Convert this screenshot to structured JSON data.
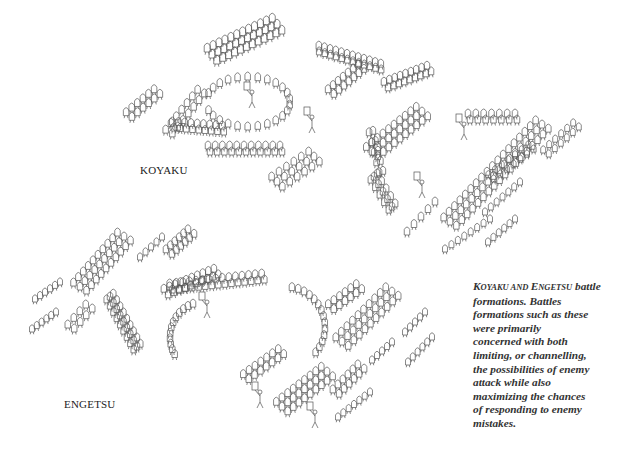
{
  "labels": {
    "koyaku": "KOYAKU",
    "engetsu": "ENGETSU"
  },
  "caption": {
    "title_parts": [
      {
        "cap": "K",
        "rest": "OYAKU"
      },
      {
        "plain": " AND "
      },
      {
        "cap": "E",
        "rest": "NGETSU"
      },
      {
        "plain": " battle"
      }
    ],
    "lines": [
      "KOYAKU AND ENGETSU battle",
      "formations. Battles",
      "formations such as these",
      "were primarily",
      "concerned with both",
      "limiting, or channelling,",
      "the possibilities of enemy",
      "attack while also",
      "maximizing the chances",
      "of responding to enemy",
      "mistakes."
    ]
  },
  "figure": {
    "stroke_color": "#555555",
    "background": "#ffffff",
    "koyaku_formations": [
      {
        "name": "left-small-squad",
        "type": "line",
        "from": [
          128,
          118
        ],
        "to": [
          156,
          95
        ],
        "count": 6,
        "rows": 2,
        "size": 10
      },
      {
        "name": "top-diagonal-column",
        "type": "line",
        "from": [
          210,
          58
        ],
        "to": [
          275,
          28
        ],
        "count": 12,
        "rows": 3,
        "size": 11
      },
      {
        "name": "left-arc-outer",
        "type": "line",
        "from": [
          168,
          135
        ],
        "to": [
          200,
          95
        ],
        "count": 7,
        "rows": 2,
        "size": 10
      },
      {
        "name": "central-ring",
        "type": "arc",
        "cx": 248,
        "cy": 105,
        "rx": 42,
        "ry": 25,
        "a0": 200,
        "a1": 520,
        "count": 24,
        "size": 10
      },
      {
        "name": "ring-left-block",
        "type": "line",
        "from": [
          172,
          128
        ],
        "to": [
          222,
          132
        ],
        "count": 9,
        "rows": 2,
        "size": 10
      },
      {
        "name": "ring-bottom-block",
        "type": "line",
        "from": [
          208,
          152
        ],
        "to": [
          280,
          152
        ],
        "count": 11,
        "rows": 2,
        "size": 10
      },
      {
        "name": "upper-right-column-1",
        "type": "line",
        "from": [
          318,
          52
        ],
        "to": [
          380,
          70
        ],
        "count": 12,
        "rows": 2,
        "size": 10
      },
      {
        "name": "upper-right-column-2",
        "type": "line",
        "from": [
          330,
          95
        ],
        "to": [
          360,
          70
        ],
        "count": 7,
        "rows": 2,
        "size": 10
      },
      {
        "name": "upper-right-column-3",
        "type": "line",
        "from": [
          385,
          88
        ],
        "to": [
          428,
          72
        ],
        "count": 9,
        "rows": 2,
        "size": 10
      },
      {
        "name": "mid-arc-column",
        "type": "line",
        "from": [
          370,
          155
        ],
        "to": [
          420,
          115
        ],
        "count": 10,
        "rows": 3,
        "size": 10
      },
      {
        "name": "mid-vertical-block",
        "type": "line",
        "from": [
          370,
          135
        ],
        "to": [
          380,
          175
        ],
        "count": 5,
        "rows": 2,
        "size": 10
      },
      {
        "name": "center-lower-block",
        "type": "line",
        "from": [
          275,
          185
        ],
        "to": [
          312,
          160
        ],
        "count": 6,
        "rows": 3,
        "size": 10
      },
      {
        "name": "pikes-block",
        "type": "line",
        "from": [
          372,
          180
        ],
        "to": [
          390,
          210
        ],
        "count": 5,
        "rows": 3,
        "size": 10
      },
      {
        "name": "bottom-small-row",
        "type": "line",
        "from": [
          407,
          235
        ],
        "to": [
          435,
          205
        ],
        "count": 5,
        "rows": 1,
        "size": 10
      },
      {
        "name": "right-top-row",
        "type": "line",
        "from": [
          468,
          120
        ],
        "to": [
          515,
          120
        ],
        "count": 7,
        "rows": 2,
        "size": 10
      },
      {
        "name": "right-long-diagonal-1",
        "type": "line",
        "from": [
          448,
          225
        ],
        "to": [
          540,
          128
        ],
        "count": 18,
        "rows": 3,
        "size": 10
      },
      {
        "name": "right-diagonal-2",
        "type": "line",
        "from": [
          490,
          180
        ],
        "to": [
          530,
          150
        ],
        "count": 7,
        "rows": 2,
        "size": 9
      },
      {
        "name": "right-diagonal-3",
        "type": "line",
        "from": [
          545,
          155
        ],
        "to": [
          575,
          128
        ],
        "count": 6,
        "rows": 2,
        "size": 9
      },
      {
        "name": "right-lower-row-1",
        "type": "line",
        "from": [
          485,
          215
        ],
        "to": [
          520,
          185
        ],
        "count": 7,
        "rows": 1,
        "size": 9
      },
      {
        "name": "right-lower-row-2",
        "type": "line",
        "from": [
          445,
          252
        ],
        "to": [
          490,
          222
        ],
        "count": 8,
        "rows": 1,
        "size": 9
      },
      {
        "name": "right-lower-row-3",
        "type": "line",
        "from": [
          488,
          245
        ],
        "to": [
          515,
          222
        ],
        "count": 6,
        "rows": 1,
        "size": 9
      }
    ],
    "koyaku_leaders": [
      {
        "name": "commander-center",
        "pos": [
          250,
          100
        ]
      },
      {
        "name": "flag-bearer-right",
        "pos": [
          462,
          132
        ]
      },
      {
        "name": "flag-bearer-lower",
        "pos": [
          420,
          190
        ]
      },
      {
        "name": "runner-center",
        "pos": [
          310,
          125
        ]
      }
    ],
    "engetsu_formations": [
      {
        "name": "left-small-row-1",
        "type": "line",
        "from": [
          35,
          302
        ],
        "to": [
          60,
          285
        ],
        "count": 6,
        "rows": 1,
        "size": 9
      },
      {
        "name": "left-small-row-2",
        "type": "line",
        "from": [
          32,
          332
        ],
        "to": [
          56,
          315
        ],
        "count": 6,
        "rows": 1,
        "size": 9
      },
      {
        "name": "left-diagonal-column",
        "type": "line",
        "from": [
          78,
          290
        ],
        "to": [
          122,
          240
        ],
        "count": 10,
        "rows": 3,
        "size": 10
      },
      {
        "name": "left-small-block",
        "type": "line",
        "from": [
          70,
          330
        ],
        "to": [
          88,
          310
        ],
        "count": 4,
        "rows": 2,
        "size": 10
      },
      {
        "name": "top-row-a",
        "type": "line",
        "from": [
          140,
          260
        ],
        "to": [
          162,
          240
        ],
        "count": 5,
        "rows": 1,
        "size": 9
      },
      {
        "name": "top-row-b",
        "type": "line",
        "from": [
          168,
          255
        ],
        "to": [
          190,
          235
        ],
        "count": 6,
        "rows": 2,
        "size": 10
      },
      {
        "name": "left-arc-block",
        "type": "line",
        "from": [
          108,
          300
        ],
        "to": [
          135,
          350
        ],
        "count": 9,
        "rows": 3,
        "size": 10
      },
      {
        "name": "right-of-left-row",
        "type": "line",
        "from": [
          165,
          295
        ],
        "to": [
          215,
          275
        ],
        "count": 10,
        "rows": 2,
        "size": 10
      },
      {
        "name": "bowl-top-row",
        "type": "line",
        "from": [
          170,
          290
        ],
        "to": [
          262,
          280
        ],
        "count": 15,
        "rows": 2,
        "size": 10
      },
      {
        "name": "bowl-left-arc",
        "type": "arc",
        "cx": 205,
        "cy": 340,
        "rx": 35,
        "ry": 35,
        "a0": 150,
        "a1": 250,
        "count": 12,
        "size": 10
      },
      {
        "name": "bowl-right-arc",
        "type": "arc",
        "cx": 285,
        "cy": 330,
        "rx": 40,
        "ry": 40,
        "a0": -80,
        "a1": 40,
        "count": 14,
        "size": 10
      },
      {
        "name": "bowl-bottom-block",
        "type": "line",
        "from": [
          245,
          380
        ],
        "to": [
          280,
          355
        ],
        "count": 7,
        "rows": 2,
        "size": 10
      },
      {
        "name": "center-small-block",
        "type": "line",
        "from": [
          330,
          310
        ],
        "to": [
          358,
          290
        ],
        "count": 6,
        "rows": 2,
        "size": 10
      },
      {
        "name": "center-diagonal-column",
        "type": "line",
        "from": [
          340,
          345
        ],
        "to": [
          390,
          295
        ],
        "count": 10,
        "rows": 3,
        "size": 10
      },
      {
        "name": "right-small-row-1",
        "type": "line",
        "from": [
          405,
          335
        ],
        "to": [
          425,
          315
        ],
        "count": 5,
        "rows": 1,
        "size": 9
      },
      {
        "name": "right-small-row-2",
        "type": "line",
        "from": [
          408,
          365
        ],
        "to": [
          432,
          340
        ],
        "count": 6,
        "rows": 1,
        "size": 9
      },
      {
        "name": "center-right-small",
        "type": "line",
        "from": [
          372,
          363
        ],
        "to": [
          392,
          345
        ],
        "count": 5,
        "rows": 1,
        "size": 9
      },
      {
        "name": "lower-pike-column",
        "type": "line",
        "from": [
          280,
          410
        ],
        "to": [
          325,
          375
        ],
        "count": 9,
        "rows": 3,
        "size": 10
      },
      {
        "name": "lower-right-block",
        "type": "line",
        "from": [
          335,
          395
        ],
        "to": [
          360,
          370
        ],
        "count": 6,
        "rows": 2,
        "size": 10
      },
      {
        "name": "lower-right-row",
        "type": "line",
        "from": [
          338,
          420
        ],
        "to": [
          370,
          395
        ],
        "count": 7,
        "rows": 1,
        "size": 9
      }
    ],
    "engetsu_leaders": [
      {
        "name": "runner-left",
        "pos": [
          205,
          310
        ]
      },
      {
        "name": "commander-bowl",
        "pos": [
          258,
          400
        ]
      },
      {
        "name": "flag-bearer-bottom",
        "pos": [
          313,
          420
        ]
      }
    ]
  }
}
